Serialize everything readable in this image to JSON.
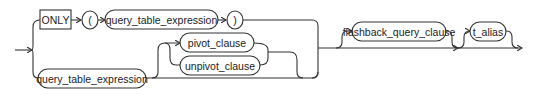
{
  "diagram": {
    "type": "railroad-syntax-diagram",
    "nodes": {
      "only_keyword": {
        "label": "ONLY",
        "shape": "rectangle"
      },
      "open_paren": {
        "label": "(",
        "shape": "circle"
      },
      "query_table_expression_top": {
        "label": "query_table_expression",
        "shape": "oval"
      },
      "close_paren": {
        "label": ")",
        "shape": "circle"
      },
      "query_table_expression_bottom": {
        "label": "query_table_expression",
        "shape": "oval"
      },
      "pivot_clause": {
        "label": "pivot_clause",
        "shape": "oval"
      },
      "unpivot_clause": {
        "label": "unpivot_clause",
        "shape": "oval"
      },
      "flashback_query_clause": {
        "label": "flashback_query_clause",
        "shape": "oval"
      },
      "t_alias": {
        "label": "t_alias",
        "shape": "oval"
      }
    },
    "colors": {
      "stroke": "#333333",
      "background": "#ffffff",
      "text": "#222222"
    }
  }
}
